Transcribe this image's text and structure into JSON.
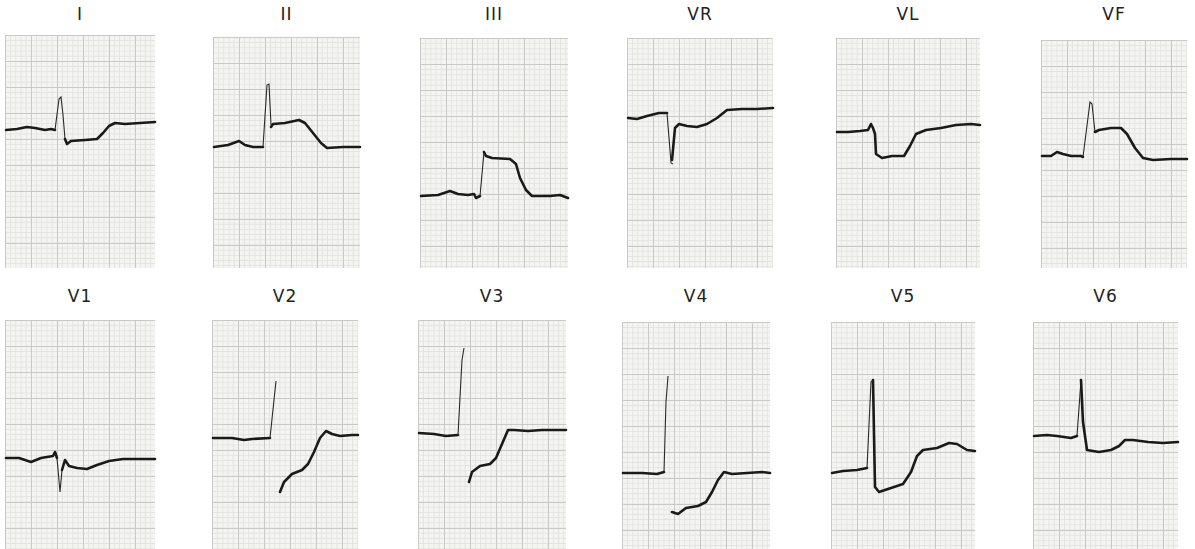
{
  "figure": {
    "rows": [
      {
        "leads": [
          {
            "label": "I",
            "box": [
              5,
              35,
              150,
              233
            ],
            "trace": "M0,95 L12,94 L25,92 L38,95 L48,93 L52,92 L54,62 L57,60 L59,80",
            "trace2": "M60,106 L64,110 L68,106 L90,104 L96,100 L104,92 L110,88 L150,88"
          },
          {
            "label": "II",
            "box": [
              213,
              35,
              147,
              233
            ],
            "trace": "M0,110 L15,108 L25,105 L35,110 L50,111 L51,110 L55,48",
            "trace2": "M58,90 L70,88 L82,86 L88,84 L96,92 L104,102 L112,111 L147,111"
          }
        ]
      }
    ]
  },
  "rows": [
    {
      "leads": [
        {
          "label": "I"
        },
        {
          "label": "II"
        },
        {
          "label": "III"
        },
        {
          "label": "VR"
        },
        {
          "label": "VL"
        },
        {
          "label": "VF"
        }
      ]
    },
    {
      "leads": [
        {
          "label": "V1"
        },
        {
          "label": "V2"
        },
        {
          "label": "V3"
        },
        {
          "label": "V4"
        },
        {
          "label": "V5"
        },
        {
          "label": "V6"
        }
      ]
    }
  ],
  "colors": {
    "paper": "#f4f4f2",
    "grid_major": "#c9c9c6",
    "grid_minor": "#e3e3e0",
    "trace": "#1a1a1a",
    "background": "#ffffff"
  }
}
